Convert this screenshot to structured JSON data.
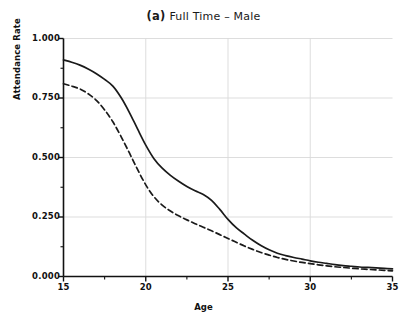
{
  "chart_data": {
    "type": "line",
    "panel_tag": "(a)",
    "title_text": "Full Time – Male",
    "xlabel": "Age",
    "ylabel": "Attendance Rate",
    "xlim": [
      15,
      35
    ],
    "ylim": [
      0.0,
      1.0
    ],
    "xticks": [
      15,
      20,
      25,
      30,
      35
    ],
    "xtick_labels": [
      "15",
      "20",
      "25",
      "30",
      "35"
    ],
    "yticks": [
      0.0,
      0.25,
      0.5,
      0.75,
      1.0
    ],
    "ytick_labels": [
      "0.000",
      "0.250",
      "0.500",
      "0.750",
      "1.000"
    ],
    "grid": true,
    "grid_color": "#d9d9d9",
    "legend": null,
    "legend_position": "none",
    "line_color": "#1a1a1a",
    "x": [
      15,
      15.5,
      16,
      16.5,
      17,
      17.5,
      18,
      18.5,
      19,
      19.5,
      20,
      20.5,
      21,
      21.5,
      22,
      22.5,
      23,
      23.5,
      24,
      24.5,
      25,
      25.5,
      26,
      26.5,
      27,
      27.5,
      28,
      28.5,
      29,
      29.5,
      30,
      30.5,
      31,
      31.5,
      32,
      32.5,
      33,
      33.5,
      34,
      34.5,
      35
    ],
    "series": [
      {
        "name": "solid",
        "style": "solid",
        "values": [
          0.91,
          0.9,
          0.888,
          0.872,
          0.852,
          0.828,
          0.8,
          0.752,
          0.69,
          0.62,
          0.552,
          0.495,
          0.455,
          0.425,
          0.4,
          0.378,
          0.36,
          0.345,
          0.32,
          0.282,
          0.24,
          0.205,
          0.178,
          0.152,
          0.13,
          0.112,
          0.098,
          0.088,
          0.08,
          0.073,
          0.066,
          0.06,
          0.055,
          0.05,
          0.046,
          0.043,
          0.04,
          0.038,
          0.036,
          0.034,
          0.032
        ]
      },
      {
        "name": "dashed",
        "style": "dashed",
        "values": [
          0.81,
          0.8,
          0.788,
          0.768,
          0.74,
          0.7,
          0.65,
          0.588,
          0.52,
          0.45,
          0.385,
          0.335,
          0.3,
          0.275,
          0.255,
          0.238,
          0.222,
          0.207,
          0.192,
          0.176,
          0.16,
          0.144,
          0.128,
          0.114,
          0.101,
          0.09,
          0.08,
          0.072,
          0.065,
          0.059,
          0.054,
          0.049,
          0.045,
          0.041,
          0.038,
          0.035,
          0.032,
          0.03,
          0.028,
          0.026,
          0.024
        ]
      }
    ]
  }
}
